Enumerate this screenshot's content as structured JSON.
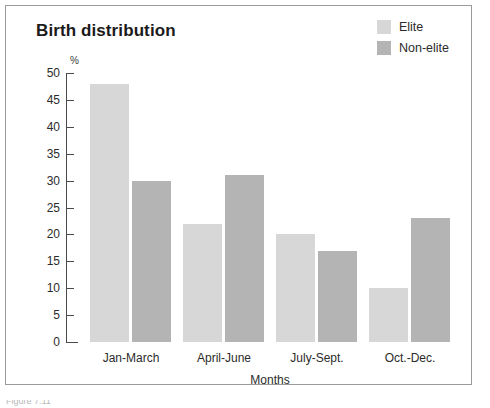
{
  "figure": {
    "caption_partial": "Figure 7.11"
  },
  "colors": {
    "elite": "#d7d7d7",
    "non_elite": "#b4b4b4",
    "axis": "#4a4a4a",
    "frame": "#9a9a9a",
    "text": "#2b2b2b"
  },
  "legend": {
    "position": "top-right",
    "entries": [
      {
        "label": "Elite",
        "color": "#d7d7d7"
      },
      {
        "label": "Non-elite",
        "color": "#b4b4b4"
      }
    ]
  },
  "chart_data": {
    "type": "bar",
    "title": "Birth distribution",
    "xlabel": "Months",
    "ylabel": "%",
    "unit": "%",
    "categories": [
      "Jan-March",
      "April-June",
      "July-Sept.",
      "Oct.-Dec."
    ],
    "series": [
      {
        "name": "Elite",
        "color": "#d7d7d7",
        "values": [
          48,
          22,
          20,
          10
        ]
      },
      {
        "name": "Non-elite",
        "color": "#b4b4b4",
        "values": [
          30,
          31,
          17,
          23
        ]
      }
    ],
    "ylim": [
      0,
      50
    ],
    "yticks": [
      0,
      5,
      10,
      15,
      20,
      25,
      30,
      35,
      40,
      45,
      50
    ],
    "grid": false,
    "legend_position": "top-right"
  }
}
